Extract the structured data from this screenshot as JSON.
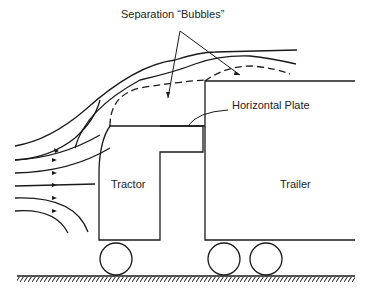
{
  "diagram": {
    "labels": {
      "separation": "Separation “Bubbles”",
      "plate": "Horizontal Plate",
      "tractor": "Tractor",
      "trailer": "Trailer"
    },
    "components": [
      "tractor",
      "trailer",
      "horizontal-plate",
      "wheels",
      "ground",
      "streamlines",
      "separation-boundaries"
    ],
    "colors": {
      "line": "#1a1a1a",
      "background": "#ffffff"
    }
  }
}
